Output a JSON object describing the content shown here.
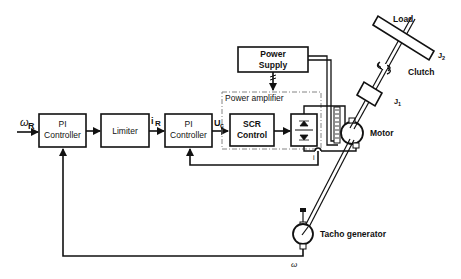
{
  "diagram": {
    "type": "control-block-diagram",
    "blocks": {
      "pi_controller_1": {
        "line1": "PI",
        "line2": "Controller"
      },
      "limiter": {
        "label": "Limiter"
      },
      "pi_controller_2": {
        "line1": "PI",
        "line2": "Controller"
      },
      "scr_control": {
        "line1": "SCR",
        "line2": "Control"
      },
      "power_supply": {
        "line1": "Power",
        "line2": "Supply"
      },
      "power_amplifier": {
        "label": "Power amplifier"
      }
    },
    "signals": {
      "omega_ref": "ω",
      "omega_ref_sub": "R",
      "current_ref": "i",
      "current_ref_sub": "R",
      "control_voltage": "U",
      "control_voltage_sub": "c",
      "current_feedback": "i",
      "speed_feedback": "ω"
    },
    "components": {
      "motor": "Motor",
      "tacho": "Tacho generator",
      "load": "Load",
      "clutch": "Clutch",
      "inertia_1": "J",
      "inertia_1_sub": "1",
      "inertia_2": "J",
      "inertia_2_sub": "2"
    }
  }
}
